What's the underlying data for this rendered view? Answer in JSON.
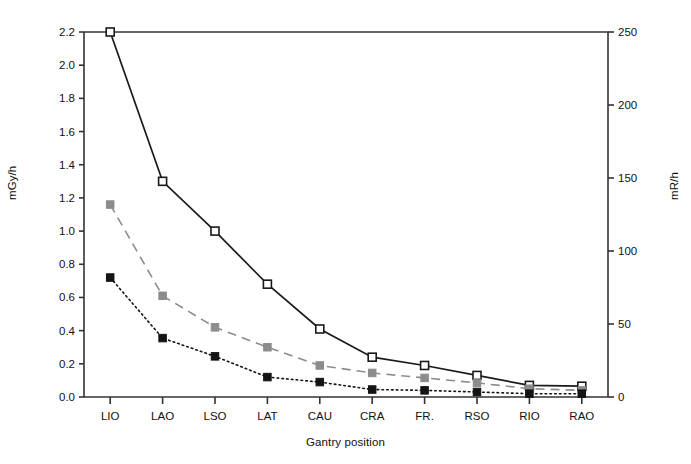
{
  "chart_data": {
    "type": "line",
    "title": "",
    "xlabel": "Gantry position",
    "ylabel": "mGy/h",
    "ylabel_secondary": "mR/h",
    "grid": false,
    "legend_position": "none",
    "categories": [
      "LIO",
      "LAO",
      "LSO",
      "LAT",
      "CAU",
      "CRA",
      "FR.",
      "RSO",
      "RIO",
      "RAO"
    ],
    "ylim": [
      0.0,
      2.2
    ],
    "yticks": [
      "0.0",
      "0.2",
      "0.4",
      "0.6",
      "0.8",
      "1.0",
      "1.2",
      "1.4",
      "1.6",
      "1.8",
      "2.0",
      "2.2"
    ],
    "ylim_secondary": [
      0,
      250
    ],
    "yticks_secondary": [
      "0",
      "50",
      "100",
      "150",
      "200",
      "250"
    ],
    "series": [
      {
        "name": "series-open-square-solid",
        "marker": "open-square",
        "line_style": "solid",
        "color": "#1a1a1a",
        "values": [
          2.2,
          1.3,
          1.0,
          0.68,
          0.41,
          0.24,
          0.19,
          0.13,
          0.07,
          0.065
        ]
      },
      {
        "name": "series-gray-square-dashed",
        "marker": "filled-square",
        "line_style": "dashed",
        "color": "#8c8c8c",
        "values": [
          1.16,
          0.61,
          0.42,
          0.3,
          0.19,
          0.145,
          0.115,
          0.085,
          0.05,
          0.04
        ]
      },
      {
        "name": "series-black-square-dotted",
        "marker": "filled-square",
        "line_style": "dotted",
        "color": "#141414",
        "values": [
          0.72,
          0.355,
          0.245,
          0.12,
          0.09,
          0.045,
          0.04,
          0.03,
          0.02,
          0.02
        ]
      }
    ]
  },
  "colors": {
    "axis": "#333333",
    "text": "#111111",
    "series_primary": "#1a1a1a",
    "series_secondary": "#8c8c8c",
    "series_tertiary": "#141414",
    "background": "#ffffff"
  }
}
